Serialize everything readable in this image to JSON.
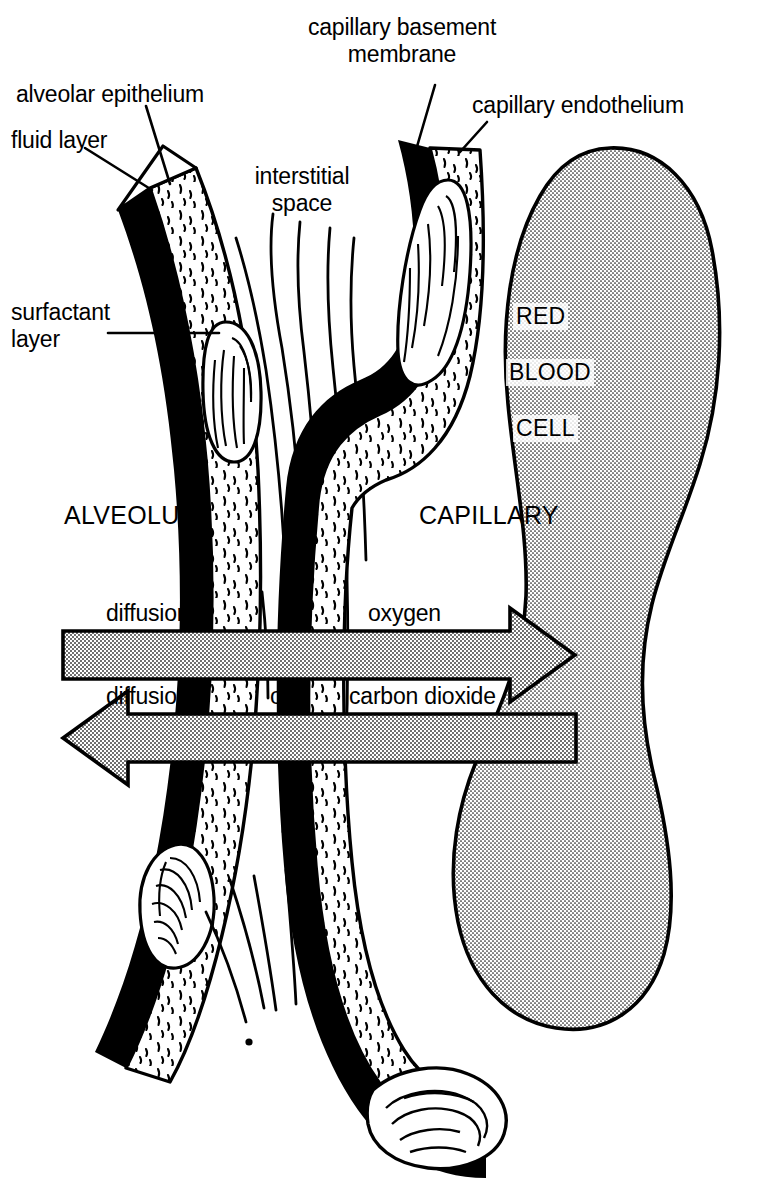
{
  "figure": {
    "type": "labeled-anatomical-diagram",
    "background_color": "#ffffff",
    "ink_color": "#000000",
    "rbc_fill_color": "#d9d9d9",
    "arrow_fill_color": "#cccccc"
  },
  "labels": {
    "capillary_basement_membrane": "capillary basement\nmembrane",
    "capillary_endothelium": "capillary endothelium",
    "alveolar_epithelium": "alveolar epithelium",
    "fluid_layer": "fluid layer",
    "interstitial_space": "interstitial\nspace",
    "surfactant_layer": "surfactant\nlayer",
    "alveolus": "ALVEOLUS",
    "capillary": "CAPILLARY",
    "red": "RED",
    "blood": "BLOOD",
    "cell": "CELL"
  },
  "arrows": {
    "oxygen": {
      "words": [
        "diffusion",
        "of",
        "oxygen"
      ],
      "full_text": "diffusion of oxygen",
      "direction": "right"
    },
    "carbon_dioxide": {
      "words": [
        "diffusion",
        "of",
        "carbon dioxide"
      ],
      "full_text": "diffusion of carbon dioxide",
      "direction": "left"
    }
  }
}
